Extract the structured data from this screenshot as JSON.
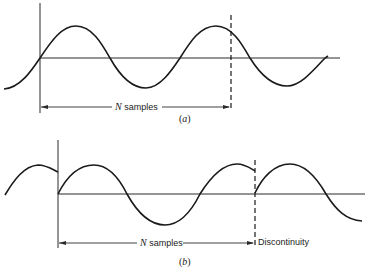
{
  "figure": {
    "panel_a": {
      "caption_open": "(",
      "caption_letter": "a",
      "caption_close": ")",
      "span_label_var": "N",
      "span_label_text": " samples"
    },
    "panel_b": {
      "caption_open": "(",
      "caption_letter": "b",
      "caption_close": ")",
      "span_label_var": "N",
      "span_label_text": " samples",
      "discontinuity_label": "Discontinuity"
    }
  },
  "colors": {
    "ink": "#1a1a1a",
    "background": "#ffffff"
  }
}
